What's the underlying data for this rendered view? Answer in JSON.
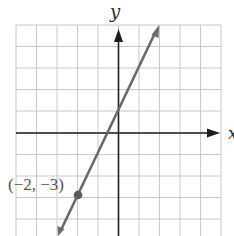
{
  "chart_data": {
    "type": "line",
    "title": "",
    "xlabel": "x",
    "ylabel": "y",
    "xlim": [
      -5,
      5
    ],
    "ylim": [
      -5,
      5
    ],
    "grid": true,
    "series": [
      {
        "name": "line",
        "equation": "y = 2x + 1",
        "x": [
          -3,
          -2,
          -1,
          0,
          1,
          2
        ],
        "y": [
          -5,
          -3,
          -1,
          1,
          3,
          5
        ]
      }
    ],
    "annotations": [
      {
        "label": "(−2, −3)",
        "x": -2,
        "y": -3
      }
    ]
  },
  "labels": {
    "y_axis": "y",
    "x_axis": "x",
    "point": "(−2, −3)"
  },
  "colors": {
    "grid": "#c8c8c8",
    "axis": "#1e1e1e",
    "line": "#6a6a6a",
    "point": "#5a5a5a"
  }
}
